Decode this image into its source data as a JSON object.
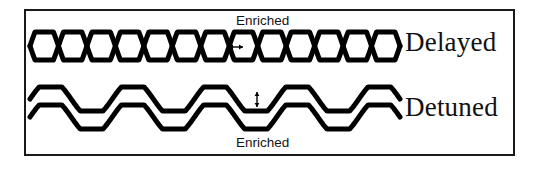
{
  "figure": {
    "title": "",
    "frame": {
      "border_color": "#1a1a1a",
      "background": "#ffffff",
      "x": 24,
      "y": 9,
      "width": 491,
      "height": 147
    },
    "stroke_color": "#000000",
    "panels": [
      {
        "id": "delayed",
        "label": "Delayed",
        "annotation_label": "Enriched",
        "annotation_position": "above",
        "arrow": {
          "name": "horizontal-double-arrow",
          "orientation": "horizontal",
          "x": 235,
          "y": 47
        },
        "description": "two interleaved clipped waves crossing with a phase delay",
        "wave_type": "clipped-sine-braided",
        "cycles": 6.5,
        "amplitude": 14,
        "baseline_y": 46,
        "phase_shift_deg": 180
      },
      {
        "id": "detuned",
        "label": "Detuned",
        "annotation_label": "Enriched",
        "annotation_position": "below",
        "arrow": {
          "name": "vertical-double-arrow",
          "orientation": "vertical",
          "x": 257,
          "y": 99
        },
        "description": "two parallel clipped waves offset vertically (detuned)",
        "wave_type": "clipped-sine-parallel",
        "cycles": 4.5,
        "amplitude": 12,
        "baseline_y_upper": 99,
        "baseline_y_lower": 117,
        "vertical_offset": 18
      }
    ]
  },
  "chart_data": {
    "type": "line",
    "title": "",
    "xlabel": "",
    "ylabel": "",
    "grid": false,
    "legend": "right",
    "x_range": [
      0,
      1
    ],
    "annotations": [
      {
        "text": "Enriched",
        "x": 0.55,
        "y": 1.0,
        "target": "delayed"
      },
      {
        "text": "Enriched",
        "x": 0.55,
        "y": 0.0,
        "target": "detuned"
      }
    ],
    "series": [
      {
        "name": "Delayed wave A",
        "panel": "delayed",
        "cycles": 6.5,
        "amplitude": 14,
        "phase_deg": 0
      },
      {
        "name": "Delayed wave B",
        "panel": "delayed",
        "cycles": 6.5,
        "amplitude": 14,
        "phase_deg": 180
      },
      {
        "name": "Detuned wave A",
        "panel": "detuned",
        "cycles": 4.5,
        "amplitude": 12,
        "phase_deg": 0,
        "offset": -9
      },
      {
        "name": "Detuned wave B",
        "panel": "detuned",
        "cycles": 4.5,
        "amplitude": 12,
        "phase_deg": 0,
        "offset": 9
      }
    ]
  }
}
